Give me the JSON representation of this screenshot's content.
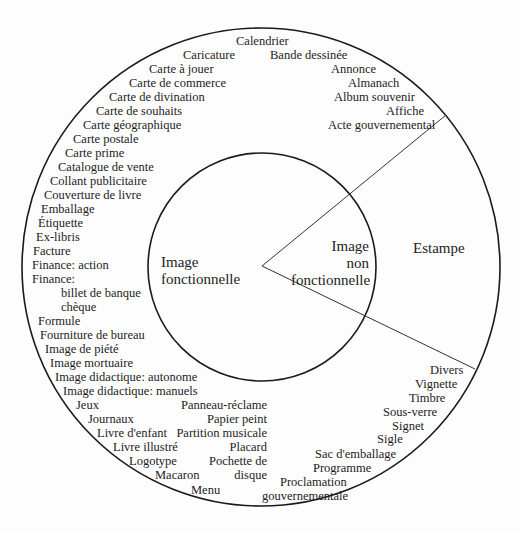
{
  "diagram": {
    "inner_left": {
      "line1": "Image",
      "line2": "fonctionnelle"
    },
    "inner_right": {
      "line1": "Image",
      "line2": "non",
      "line3": "fonctionnelle"
    },
    "outer_right": "Estampe",
    "functional_items": [
      "Calendrier",
      "Caricature",
      "Bande dessinée",
      "Carte à jouer",
      "Annonce",
      "Carte de commerce",
      "Almanach",
      "Carte de divination",
      "Album souvenir",
      "Carte de souhaits",
      "Affiche",
      "Carte géographique",
      "Acte gouvernemental",
      "Carte postale",
      "Carte prime",
      "Catalogue de vente",
      "Collant publicitaire",
      "Couverture de livre",
      "Emballage",
      "Étiquette",
      "Ex-libris",
      "Facture",
      "Finance: action",
      "Finance:",
      "billet de banque",
      "chèque",
      "Formule",
      "Fourniture de bureau",
      "Image de piété",
      "Image mortuaire",
      "Image didactique: autonome",
      "Image didactique: manuels",
      "Jeux",
      "Panneau-réclame",
      "Journaux",
      "Papier peint",
      "Livre d'enfant",
      "Partition musicale",
      "Livre illustré",
      "Placard",
      "Logotype",
      "Pochette de",
      "disque",
      "Macaron",
      "Menu",
      "Proclamation",
      "gouvernementale",
      "Programme",
      "Sac d'emballage",
      "Sigle",
      "Signet",
      "Sous-verre",
      "Timbre",
      "Vignette",
      "Divers"
    ]
  },
  "geometry": {
    "outer_circle": {
      "cx": 261,
      "cy": 267,
      "r": 239
    },
    "inner_circle": {
      "cx": 262,
      "cy": 267,
      "r": 114
    },
    "wedge_vertex": [
      262,
      266
    ],
    "wedge_upper_end": [
      446,
      115
    ],
    "wedge_lower_end": [
      475,
      369
    ],
    "stroke_color": "#1a1a1a"
  }
}
